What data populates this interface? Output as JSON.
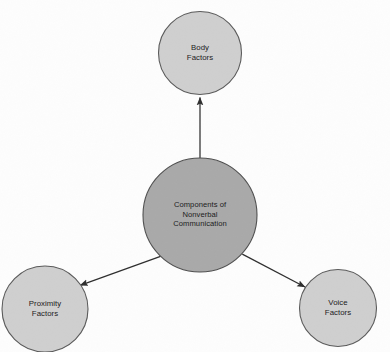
{
  "diagram": {
    "type": "radial-hub-and-spoke",
    "background_color": "#fdfdfd",
    "hub": {
      "id": "components-of-nonverbal-communication",
      "label": "Components of\nNonverbal\nCommunication",
      "cx": 200,
      "cy": 215,
      "r": 57,
      "fill": "#a9a9a9",
      "stroke": "#4f4f4f"
    },
    "nodes": [
      {
        "id": "body-factors",
        "label": "Body\nFactors",
        "cx": 200,
        "cy": 53,
        "r": 41.5,
        "fill": "#cfcfcf",
        "stroke": "#5a5a5a"
      },
      {
        "id": "proximity-factors",
        "label": "Proximity\nFactors",
        "cx": 45,
        "cy": 309,
        "r": 43,
        "fill": "#cfcfcf",
        "stroke": "#5a5a5a"
      },
      {
        "id": "voice-factors",
        "label": "Voice\nFactors",
        "cx": 338,
        "cy": 308,
        "r": 38.5,
        "fill": "#cfcfcf",
        "stroke": "#5a5a5a"
      }
    ],
    "connectors": [
      {
        "id": "hub-to-body-factors",
        "from": "components-of-nonverbal-communication",
        "to": "body-factors",
        "direction": "up",
        "arrowhead": "solid-triangle",
        "color": "#2e2e2e"
      },
      {
        "id": "hub-to-proximity-factors",
        "from": "components-of-nonverbal-communication",
        "to": "proximity-factors",
        "direction": "down-left",
        "arrowhead": "solid-triangle",
        "color": "#2e2e2e"
      },
      {
        "id": "hub-to-voice-factors",
        "from": "components-of-nonverbal-communication",
        "to": "voice-factors",
        "direction": "down-right",
        "arrowhead": "solid-triangle",
        "color": "#2e2e2e"
      }
    ]
  }
}
